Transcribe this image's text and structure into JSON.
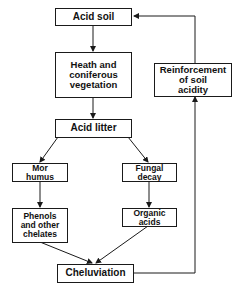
{
  "diagram": {
    "type": "flowchart",
    "nodes": {
      "acid_soil": "Acid soil",
      "heath": "Heath and\nconiferous\nvegetation",
      "acid_litter": "Acid litter",
      "mor_humus": "Mor\nhumus",
      "fungal_decay": "Fungal\ndecay",
      "phenols": "Phenols\nand other\nchelates",
      "organic_acids": "Organic\nacids",
      "cheluviation": "Cheluviation",
      "reinforcement": "Reinforcement\nof soil\nacidity"
    },
    "edges": [
      {
        "from": "Acid soil",
        "to": "Heath and coniferous vegetation"
      },
      {
        "from": "Heath and coniferous vegetation",
        "to": "Acid litter"
      },
      {
        "from": "Acid litter",
        "to": "Mor humus"
      },
      {
        "from": "Acid litter",
        "to": "Fungal decay"
      },
      {
        "from": "Mor humus",
        "to": "Phenols and other chelates"
      },
      {
        "from": "Fungal decay",
        "to": "Organic acids"
      },
      {
        "from": "Phenols and other chelates",
        "to": "Cheluviation"
      },
      {
        "from": "Organic acids",
        "to": "Cheluviation"
      },
      {
        "from": "Cheluviation",
        "to": "Reinforcement of soil acidity"
      },
      {
        "from": "Reinforcement of soil acidity",
        "to": "Acid soil"
      }
    ],
    "colors": {
      "line": "#1a1a1a",
      "background": "#ffffff"
    }
  }
}
